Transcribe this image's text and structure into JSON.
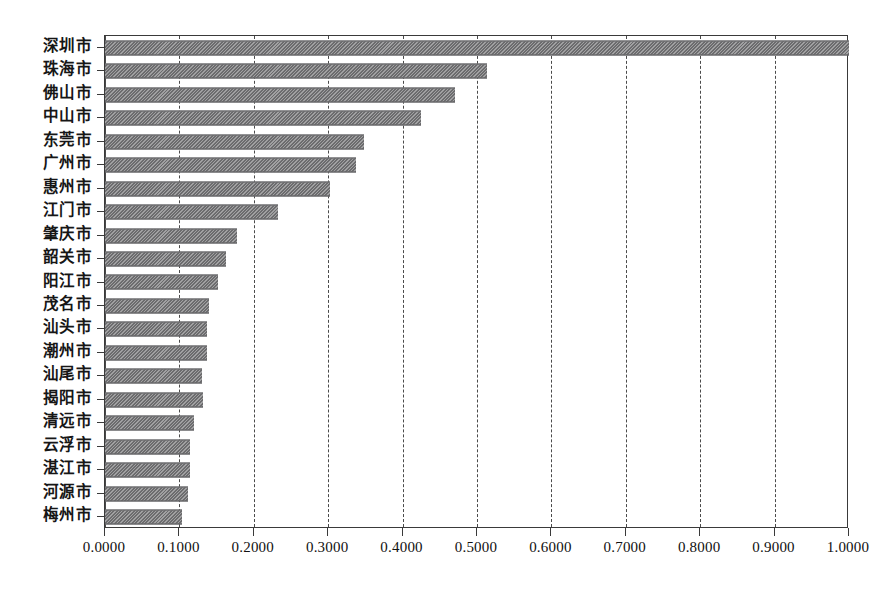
{
  "chart_data": {
    "type": "bar",
    "orientation": "horizontal",
    "title": "",
    "xlabel": "",
    "ylabel": "",
    "xlim": [
      0.0,
      1.0
    ],
    "xticks": [
      "0.0000",
      "0.1000",
      "0.2000",
      "0.3000",
      "0.4000",
      "0.5000",
      "0.6000",
      "0.7000",
      "0.8000",
      "0.9000",
      "1.0000"
    ],
    "xtick_values": [
      0.0,
      0.1,
      0.2,
      0.3,
      0.4,
      0.5,
      0.6,
      0.7,
      0.8,
      0.9,
      1.0
    ],
    "tick_decimals": 4,
    "grid": "vertical-dashed",
    "legend": "none",
    "bar_color": "#78787a",
    "bar_pattern": "diagonal-hatch",
    "plot_border_color": "#3a3a3a",
    "background_color": "#ffffff",
    "categories": [
      "深圳市",
      "珠海市",
      "佛山市",
      "中山市",
      "东莞市",
      "广州市",
      "惠州市",
      "江门市",
      "肇庆市",
      "韶关市",
      "阳江市",
      "茂名市",
      "汕头市",
      "潮州市",
      "汕尾市",
      "揭阳市",
      "清远市",
      "云浮市",
      "湛江市",
      "河源市",
      "梅州市"
    ],
    "values": [
      1.0,
      0.513,
      0.471,
      0.425,
      0.348,
      0.338,
      0.303,
      0.232,
      0.178,
      0.163,
      0.152,
      0.14,
      0.137,
      0.137,
      0.13,
      0.132,
      0.119,
      0.114,
      0.114,
      0.112,
      0.104
    ]
  }
}
